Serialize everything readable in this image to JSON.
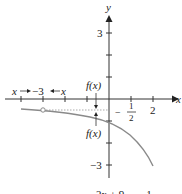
{
  "diagram": {
    "axes": {
      "x_label": "x",
      "y_label": "y"
    },
    "x_ticks": [
      {
        "label": "−3",
        "value": -3
      },
      {
        "label": "2",
        "value": 2
      }
    ],
    "x_tick_fraction": {
      "sign": "−",
      "numerator": "1",
      "denominator": "2",
      "value": -0.5
    },
    "y_ticks": [
      {
        "label": "3",
        "value": 3
      },
      {
        "label": "−3",
        "value": -3
      }
    ],
    "annotations": {
      "x_left": "x",
      "x_right": "x",
      "fx_top": "f(x)",
      "fx_bottom": "f(x)"
    },
    "asymptote": {
      "type": "horizontal",
      "y": -0.5,
      "style": "dotted"
    },
    "open_point": {
      "x": -3,
      "y": -0.5
    },
    "caption_partial": "2x + 9        1",
    "colors": {
      "axes": "#333333",
      "curve": "#8a8a8a",
      "asymptote": "#aaaaaa",
      "text": "#222222"
    }
  }
}
